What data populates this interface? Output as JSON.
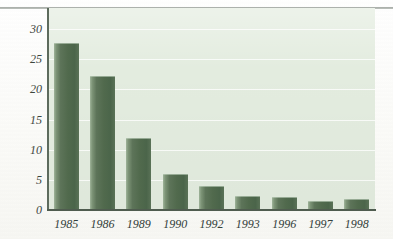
{
  "chart_data": {
    "type": "bar",
    "title": "",
    "subtitle": "",
    "xlabel": "",
    "ylabel": "",
    "categories": [
      "1985",
      "1986",
      "1989",
      "1990",
      "1992",
      "1993",
      "1996",
      "1997",
      "1998"
    ],
    "values": [
      27.7,
      22.2,
      12.0,
      6.0,
      4.0,
      2.3,
      2.1,
      1.5,
      1.9
    ],
    "series": [
      {
        "name": "",
        "values": [
          27.7,
          22.2,
          12.0,
          6.0,
          4.0,
          2.3,
          2.1,
          1.5,
          1.9
        ]
      }
    ],
    "ylim": [
      0,
      33.5
    ],
    "ytick_labels": [
      "0",
      "5",
      "10",
      "15",
      "20",
      "25",
      "30"
    ],
    "ytick_values": [
      0,
      5,
      10,
      15,
      20,
      25,
      30
    ],
    "xtick_labels": [
      "1985",
      "1986",
      "1989",
      "1990",
      "1992",
      "1993",
      "1996",
      "1997",
      "1998"
    ],
    "grid": "horizontal",
    "legend": "none",
    "annotations": [],
    "colors": {
      "bar_fill_dark": "#4b654a",
      "bar_fill_mid": "#5d7459",
      "bar_highlight": "#9fb49a",
      "plot_background": "#e3ecdf",
      "gridline": "#ffffff",
      "axis_line": "#4f5c4f",
      "tick_label": "#3d463d",
      "page_background": "#fdfdfb",
      "top_rule": "#9fa59f"
    }
  }
}
